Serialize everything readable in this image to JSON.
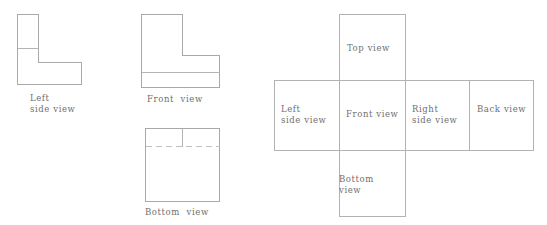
{
  "figure": {
    "kind": "orthographic-projection-and-box-net",
    "line_color": "#a9a9a9",
    "hidden_line_color": "#c0c0c0",
    "text_color": "#6f6f6f",
    "background": "#ffffff"
  },
  "projection_views": {
    "left_side": {
      "caption_line1": "Left",
      "caption_line2": "side view",
      "shape": "L-shape with horizontal division line",
      "outline_points": "17,14 38,14 38,62 81,62 81,84 17,84",
      "inner_line": "17,48 38,48"
    },
    "front": {
      "caption": "Front  view",
      "shape": "mirrored L-shape with horizontal division line",
      "outline_points": "141,14 182,14 182,55 219,55 219,87 141,87",
      "inner_line": "141,72 219,72"
    },
    "bottom": {
      "caption": "Bottom  view",
      "shape": "square with vertical solid divider and horizontal hidden (dashed) line",
      "outline_points": "145,128 219,128 219,201 145,201",
      "vertical_line": "182,128 182,146",
      "dashed_line": "145,146 219,146"
    }
  },
  "box_net": {
    "title_cells": [
      {
        "name": "top-view",
        "label_line1": "Top view",
        "label_line2": ""
      },
      {
        "name": "left-side-view",
        "label_line1": "Left",
        "label_line2": "side view"
      },
      {
        "name": "front-view",
        "label_line1": "Front view",
        "label_line2": ""
      },
      {
        "name": "right-side-view",
        "label_line1": "Right",
        "label_line2": "side view"
      },
      {
        "name": "back-view",
        "label_line1": "Back view",
        "label_line2": ""
      },
      {
        "name": "bottom-view",
        "label_line1": "Bottom",
        "label_line2": "view"
      }
    ],
    "grid": {
      "row_top": 80,
      "row_bottom": 150,
      "col_left": 274,
      "col_front_start": 339,
      "col_front_end": 405,
      "col_right_end": 469,
      "col_back_end": 533,
      "top_cell_y": 14,
      "bottom_cell_y": 216
    }
  }
}
